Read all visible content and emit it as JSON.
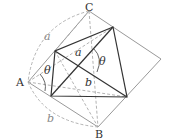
{
  "diagram": {
    "vertex_labels": {
      "A": "A",
      "B": "B",
      "C": "C"
    },
    "segment_labels": {
      "outer_a": "a",
      "outer_b": "b",
      "inner_a": "a",
      "inner_b": "b"
    },
    "angle_labels": {
      "at_A": "θ",
      "at_center": "θ"
    },
    "colors": {
      "solid_dark": "#333333",
      "solid_light": "#999999",
      "dashed": "#aaaaaa"
    }
  }
}
